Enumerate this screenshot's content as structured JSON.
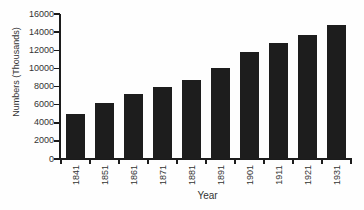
{
  "chart_data": {
    "type": "bar",
    "title": "",
    "xlabel": "Year",
    "ylabel": "Numbers (Thousands)",
    "categories": [
      "1841",
      "1851",
      "1861",
      "1871",
      "1881",
      "1891",
      "1901",
      "1911",
      "1921",
      "1931"
    ],
    "values": [
      5000,
      6200,
      7200,
      7900,
      8700,
      10000,
      11800,
      12800,
      13700,
      14800
    ],
    "ylim": [
      0,
      16000
    ],
    "y_ticks": [
      0,
      2000,
      4000,
      6000,
      8000,
      10000,
      12000,
      14000,
      16000
    ],
    "grid": false,
    "legend_position": "none",
    "colors": {
      "bar": "#1d1d1d",
      "axis": "#1c1c1c",
      "text": "#333333",
      "background": "#fefefe"
    }
  }
}
